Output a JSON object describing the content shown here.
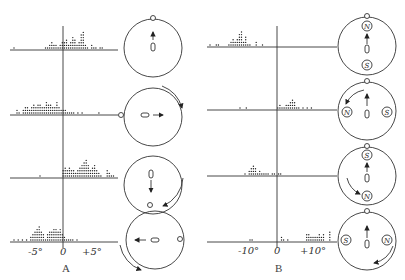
{
  "figure": {
    "panels": [
      {
        "id": "A",
        "label": "A",
        "axis_ticks": [
          "-5°",
          "0",
          "+5°"
        ],
        "rows": [
          {
            "lamp": "top",
            "arrow": "up",
            "rotation": "none",
            "magnets": []
          },
          {
            "lamp": "left",
            "arrow": "right",
            "rotation": "clockwise-upper-right",
            "magnets": []
          },
          {
            "lamp": "bottom",
            "arrow": "down",
            "rotation": "counterclockwise-lower-right",
            "magnets": []
          },
          {
            "lamp": "right",
            "arrow": "left",
            "rotation": "counterclockwise-lower-left",
            "magnets": []
          }
        ]
      },
      {
        "id": "B",
        "label": "B",
        "axis_ticks": [
          "-10°",
          "0",
          "+10°"
        ],
        "rows": [
          {
            "lamp": "top",
            "arrow": "up",
            "rotation": "none",
            "magnets": [
              {
                "pole": "N",
                "pos": "top"
              },
              {
                "pole": "S",
                "pos": "bottom"
              }
            ]
          },
          {
            "lamp": "top",
            "arrow": "up",
            "rotation": "counterclockwise-upper-left",
            "magnets": [
              {
                "pole": "N",
                "pos": "left"
              },
              {
                "pole": "S",
                "pos": "right"
              }
            ]
          },
          {
            "lamp": "top",
            "arrow": "up",
            "rotation": "counterclockwise-lower-left",
            "magnets": [
              {
                "pole": "S",
                "pos": "top"
              },
              {
                "pole": "N",
                "pos": "bottom"
              }
            ]
          },
          {
            "lamp": "top",
            "arrow": "up",
            "rotation": "counterclockwise-lower-right",
            "magnets": [
              {
                "pole": "S",
                "pos": "left"
              },
              {
                "pole": "N",
                "pos": "right"
              }
            ]
          }
        ]
      }
    ]
  },
  "labels": {
    "a_minus": "-5°",
    "a_zero": "0",
    "a_plus": "+5°",
    "a_panel": "A",
    "b_minus": "-10°",
    "b_zero": "0",
    "b_plus": "+10°",
    "b_panel": "B",
    "n": "N",
    "s": "S"
  }
}
